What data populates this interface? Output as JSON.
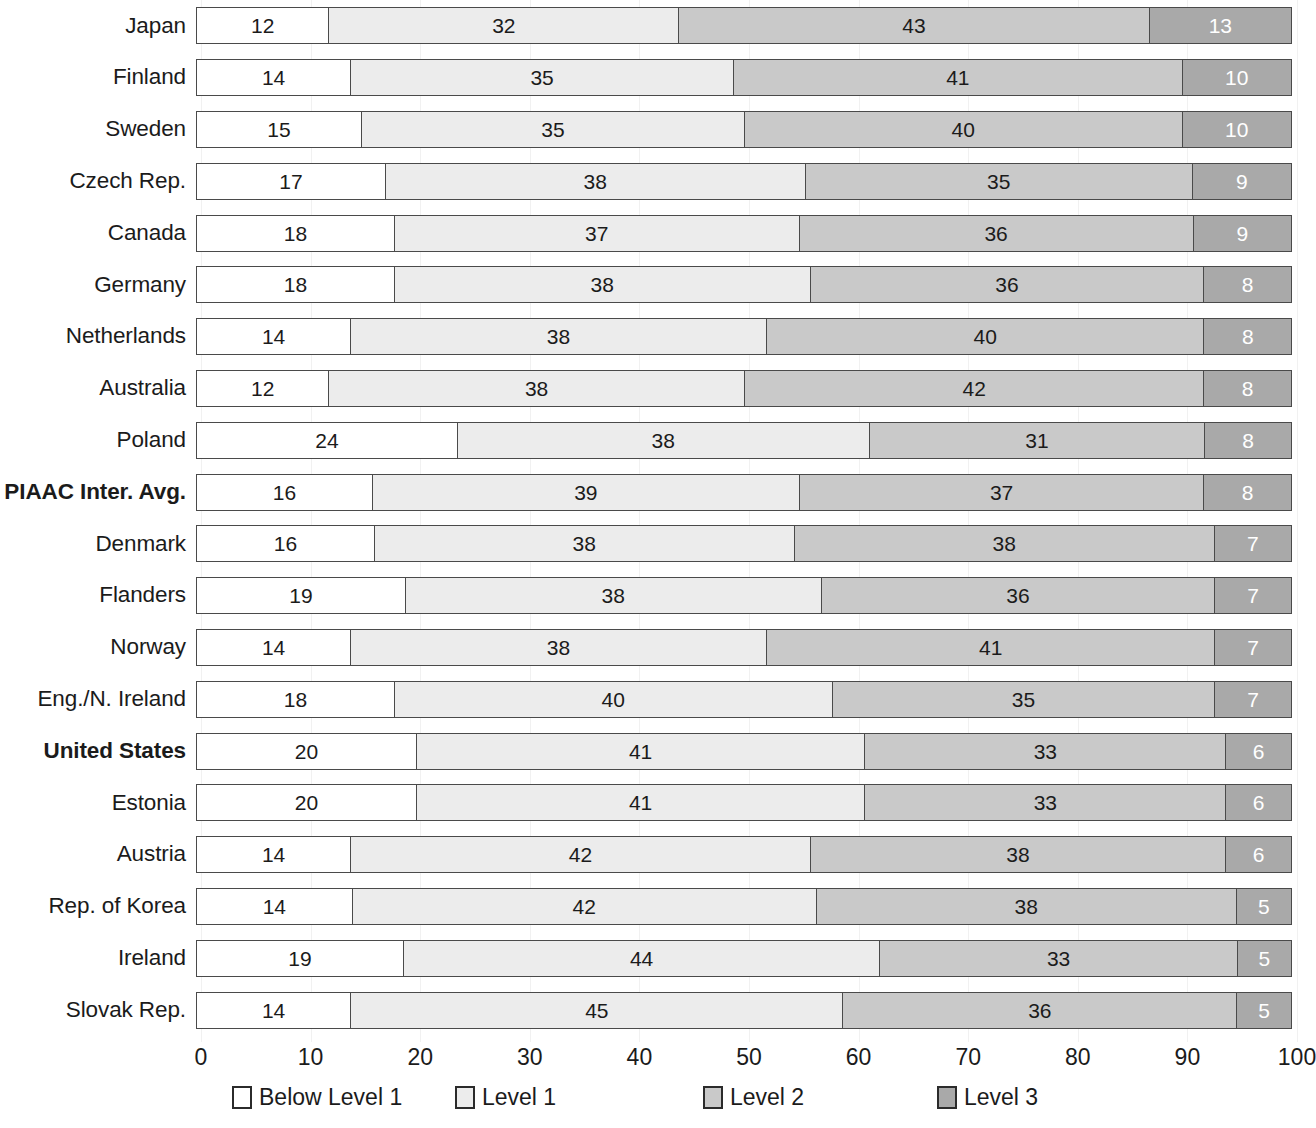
{
  "chart_data": {
    "type": "bar",
    "orientation": "horizontal",
    "stacked": true,
    "stack_mode": "percent",
    "title": "",
    "subtitle": "",
    "xlabel": "",
    "ylabel": "",
    "xlim": [
      0,
      100
    ],
    "xticks": [
      0,
      10,
      20,
      30,
      40,
      50,
      60,
      70,
      80,
      90,
      100
    ],
    "xticklabels": [
      "0",
      "10",
      "20",
      "30",
      "40",
      "50",
      "60",
      "70",
      "80",
      "90",
      "100"
    ],
    "grid": true,
    "grid_axis": "x",
    "legend_position": "bottom",
    "categories": [
      "Japan",
      "Finland",
      "Sweden",
      "Czech Rep.",
      "Canada",
      "Germany",
      "Netherlands",
      "Australia",
      "Poland",
      "PIAAC Inter. Avg.",
      "Denmark",
      "Flanders",
      "Norway",
      "Eng./N. Ireland",
      "United States",
      "Estonia",
      "Austria",
      "Rep. of Korea",
      "Ireland",
      "Slovak Rep."
    ],
    "emphasized_categories": [
      "PIAAC Inter. Avg.",
      "United States"
    ],
    "series": [
      {
        "name": "Below Level 1",
        "color": "#ffffff",
        "values": [
          12,
          14,
          15,
          17,
          18,
          18,
          14,
          12,
          24,
          16,
          16,
          19,
          14,
          18,
          20,
          20,
          14,
          14,
          19,
          14
        ]
      },
      {
        "name": "Level 1",
        "color": "#ececec",
        "values": [
          32,
          35,
          35,
          38,
          37,
          38,
          38,
          38,
          38,
          39,
          38,
          38,
          38,
          40,
          41,
          41,
          42,
          42,
          44,
          45
        ]
      },
      {
        "name": "Level 2",
        "color": "#c9c9c9",
        "values": [
          43,
          41,
          40,
          35,
          36,
          36,
          40,
          42,
          31,
          37,
          38,
          36,
          41,
          35,
          33,
          33,
          38,
          38,
          33,
          36
        ]
      },
      {
        "name": "Level 3",
        "color": "#a9a9a9",
        "values": [
          13,
          10,
          10,
          9,
          9,
          8,
          8,
          8,
          8,
          8,
          7,
          7,
          7,
          7,
          6,
          6,
          6,
          5,
          5,
          5
        ]
      }
    ]
  },
  "legend": {
    "items": [
      {
        "label": "Below Level 1",
        "color": "#ffffff",
        "left_px": 232
      },
      {
        "label": "Level 1",
        "color": "#ececec",
        "left_px": 455
      },
      {
        "label": "Level 2",
        "color": "#c9c9c9",
        "left_px": 703
      },
      {
        "label": "Level 3",
        "color": "#a9a9a9",
        "left_px": 937
      }
    ]
  }
}
